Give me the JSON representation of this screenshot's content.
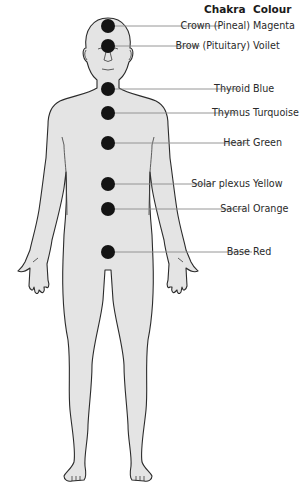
{
  "header": {
    "chakra": "Chakra",
    "colour": "Colour"
  },
  "chakras": [
    {
      "name": "Crown (Pineal)",
      "colour": "Magenta",
      "y": 26
    },
    {
      "name": "Brow (Pituitary)",
      "colour": "Voilet",
      "y": 46
    },
    {
      "name": "Thyroid",
      "colour": "Blue",
      "y": 89
    },
    {
      "name": "Thymus",
      "colour": "Turquoise",
      "y": 113
    },
    {
      "name": "Heart",
      "colour": "Green",
      "y": 143
    },
    {
      "name": "Solar plexus",
      "colour": "Yellow",
      "y": 184
    },
    {
      "name": "Sacral",
      "colour": "Orange",
      "y": 209
    },
    {
      "name": "Base",
      "colour": "Red",
      "y": 252
    }
  ],
  "style": {
    "body_fill": "#e4e4e4",
    "outline": "#2b2b2b",
    "dot": "#141414",
    "leader": "#8a8a8a"
  }
}
